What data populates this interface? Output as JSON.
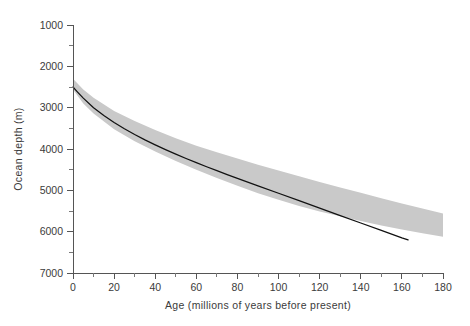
{
  "figure": {
    "background_color": "#ffffff",
    "band_color": "#c9c9c9",
    "curve_color": "#111111",
    "axis_color": "#555555",
    "text_color": "#3b3b3b"
  },
  "chart_data": {
    "type": "line",
    "title": "",
    "subtitle": "",
    "xlabel": "Age  (millions of years before present)",
    "ylabel": "Ocean depth (m)",
    "xlim": [
      0,
      180
    ],
    "ylim": [
      1000,
      7000
    ],
    "y_inverted": true,
    "grid": false,
    "legend": "none",
    "x_ticks": [
      0,
      20,
      40,
      60,
      80,
      100,
      120,
      140,
      160,
      180
    ],
    "x_tick_labels": [
      "0",
      "20",
      "40",
      "60",
      "80",
      "100",
      "120",
      "140",
      "160",
      "180"
    ],
    "x_minor_ticks": [
      10,
      30,
      50,
      70,
      90,
      110,
      130,
      150,
      170
    ],
    "y_ticks": [
      1000,
      2000,
      3000,
      4000,
      5000,
      6000,
      7000
    ],
    "y_tick_labels": [
      "1000",
      "2000",
      "3000",
      "4000",
      "5000",
      "6000",
      "7000"
    ],
    "y_minor_ticks": [
      1500,
      2500,
      3500,
      4500,
      5500,
      6500
    ],
    "series": [
      {
        "name": "model-curve",
        "type": "line",
        "style": "solid-black",
        "x": [
          0,
          2,
          5,
          10,
          15,
          20,
          25,
          30,
          35,
          40,
          45,
          50,
          55,
          60,
          65,
          70,
          75,
          80,
          90,
          100,
          110,
          120,
          130,
          140,
          150,
          160,
          163
        ],
        "y": [
          2500,
          2610,
          2770,
          3000,
          3190,
          3360,
          3510,
          3650,
          3780,
          3900,
          4015,
          4125,
          4230,
          4330,
          4430,
          4525,
          4620,
          4710,
          4890,
          5070,
          5250,
          5430,
          5610,
          5790,
          5970,
          6150,
          6200
        ]
      },
      {
        "name": "uncertainty-band-upper",
        "type": "band-edge",
        "x": [
          0,
          5,
          10,
          20,
          30,
          40,
          50,
          60,
          70,
          80,
          90,
          100,
          110,
          120,
          130,
          140,
          150,
          160,
          170,
          180
        ],
        "y": [
          2300,
          2560,
          2760,
          3080,
          3320,
          3540,
          3740,
          3920,
          4080,
          4230,
          4380,
          4520,
          4660,
          4800,
          4930,
          5060,
          5190,
          5320,
          5440,
          5560
        ]
      },
      {
        "name": "uncertainty-band-lower",
        "type": "band-edge",
        "x": [
          0,
          5,
          10,
          20,
          30,
          40,
          50,
          60,
          70,
          80,
          90,
          100,
          110,
          120,
          130,
          140,
          150,
          160,
          170,
          180
        ],
        "y": [
          2560,
          2900,
          3140,
          3520,
          3810,
          4060,
          4290,
          4500,
          4700,
          4890,
          5070,
          5230,
          5380,
          5510,
          5630,
          5740,
          5850,
          5950,
          6040,
          6120
        ]
      }
    ],
    "annotations": []
  }
}
